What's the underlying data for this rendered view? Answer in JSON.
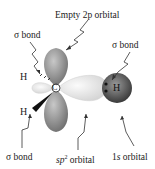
{
  "diagram": {
    "type": "orbital-diagram",
    "title": "",
    "labels": {
      "empty_p": "Empty 2p orbital",
      "sigma_top_left": "σ bond",
      "sigma_top_right": "σ bond",
      "sigma_bottom_left": "σ bond",
      "sp2": "sp² orbital",
      "s1": "1s orbital"
    },
    "atoms": {
      "carbon": "C",
      "h_upper": "H",
      "h_lower": "H",
      "h_right": "H"
    },
    "colors": {
      "p_lobe": "#8a8a8a",
      "sp2_lobe": "#e8e8e8",
      "h_sphere": "#5a5a5a",
      "text": "#222222"
    }
  }
}
